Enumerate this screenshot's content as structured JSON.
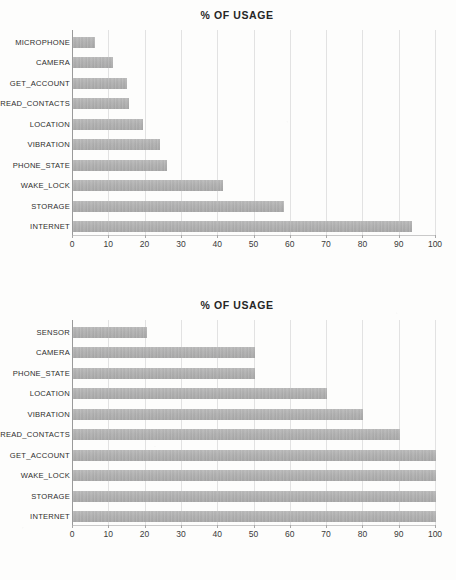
{
  "page": {
    "background_color": "#fdfdfc",
    "bar_color": "#a8a8a8",
    "grid_color": "#e2e2e2",
    "axis_color": "#9a9a9a",
    "text_color": "#2d2d2d"
  },
  "charts": [
    {
      "id": "chart-1",
      "title": "% OF USAGE",
      "chart_data": {
        "type": "bar",
        "orientation": "horizontal",
        "title": "% OF USAGE",
        "xlabel": "",
        "ylabel": "",
        "xlim": [
          0,
          100
        ],
        "xticks": [
          0,
          10,
          20,
          30,
          40,
          50,
          60,
          70,
          80,
          90,
          100
        ],
        "xtick_labels": [
          "0",
          "10",
          "20",
          "30",
          "40",
          "50",
          "60",
          "70",
          "80",
          "90",
          "100"
        ],
        "grid": true,
        "legend": false,
        "categories": [
          "MICROPHONE",
          "CAMERA",
          "GET_ACCOUNT",
          "READ_CONTACTS",
          "LOCATION",
          "VIBRATION",
          "PHONE_STATE",
          "WAKE_LOCK",
          "STORAGE",
          "INTERNET"
        ],
        "values": [
          6,
          11,
          15,
          15.3,
          19.3,
          24,
          26,
          41.3,
          58,
          93.5
        ]
      }
    },
    {
      "id": "chart-2",
      "title": "% OF USAGE",
      "chart_data": {
        "type": "bar",
        "orientation": "horizontal",
        "title": "% OF USAGE",
        "xlabel": "",
        "ylabel": "",
        "xlim": [
          0,
          100
        ],
        "xticks": [
          0,
          10,
          20,
          30,
          40,
          50,
          60,
          70,
          80,
          90,
          100
        ],
        "xtick_labels": [
          "0",
          "10",
          "20",
          "30",
          "40",
          "50",
          "60",
          "70",
          "80",
          "90",
          "100"
        ],
        "grid": true,
        "legend": false,
        "categories": [
          "SENSOR",
          "CAMERA",
          "PHONE_STATE",
          "LOCATION",
          "VIBRATION",
          "READ_CONTACTS",
          "GET_ACCOUNT",
          "WAKE_LOCK",
          "STORAGE",
          "INTERNET"
        ],
        "values": [
          20.5,
          50,
          50,
          70,
          80,
          90,
          100,
          100,
          100,
          100
        ]
      }
    }
  ]
}
